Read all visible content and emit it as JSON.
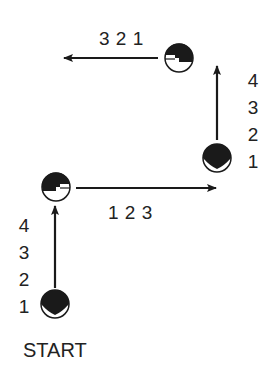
{
  "diagram": {
    "type": "marching-step-pattern",
    "start_label": "START",
    "colors": {
      "ink": "#1a1a1a",
      "background": "#ffffff"
    },
    "legs": [
      {
        "direction": "up",
        "counts": [
          "1",
          "2",
          "3",
          "4"
        ],
        "label_side": "left"
      },
      {
        "direction": "right",
        "counts_text": "1 2 3",
        "label_side": "below"
      },
      {
        "direction": "up",
        "counts": [
          "1",
          "2",
          "3",
          "4"
        ],
        "label_side": "right"
      },
      {
        "direction": "left",
        "counts_text": "3 2 1",
        "label_side": "above"
      }
    ],
    "figures": [
      {
        "name": "start-figure",
        "facing": "up"
      },
      {
        "name": "turn-1-figure",
        "facing": "right"
      },
      {
        "name": "turn-2-figure",
        "facing": "up"
      },
      {
        "name": "turn-3-figure",
        "facing": "left"
      }
    ]
  }
}
